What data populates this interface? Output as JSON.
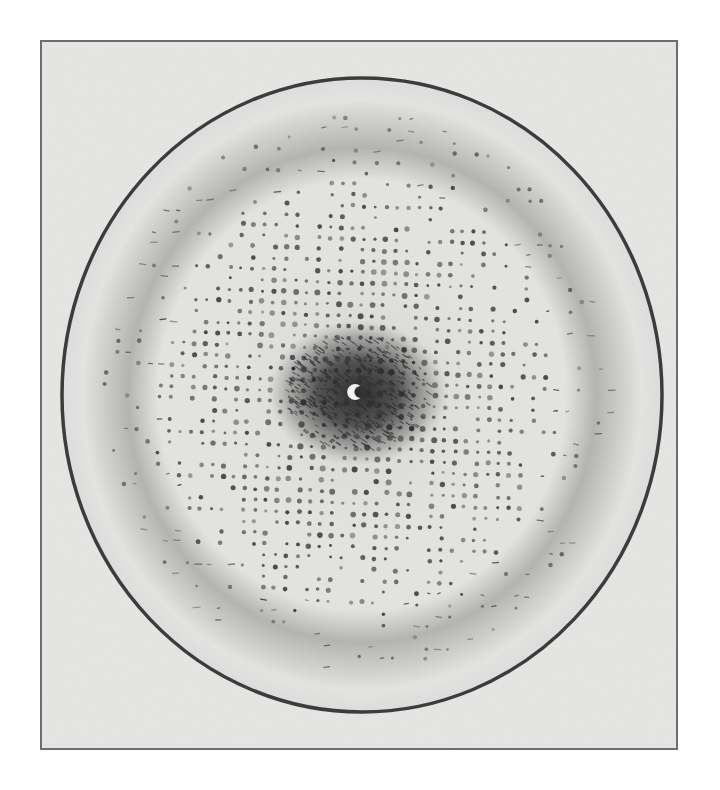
{
  "figure": {
    "caption": ""
  },
  "canvas": {
    "width": 720,
    "height": 790,
    "background": "#ffffff"
  },
  "frame": {
    "x": 41,
    "y": 41,
    "width": 636,
    "height": 708,
    "fill": "#e6e6e4",
    "stroke": "#6b6b6b",
    "stroke_width": 2
  },
  "film": {
    "cx": 362,
    "cy": 395,
    "rx": 300,
    "ry": 317,
    "edge_color": "#3c3c3c",
    "edge_width": 3.5,
    "fill_center": "#d7d7d5",
    "fill_mid": "#e4e4e2",
    "halo_color": "#b3b3b1",
    "halo_radius_fraction": 0.78,
    "outer_color": "#dedede"
  },
  "pattern": {
    "center": {
      "x": 358,
      "y": 393
    },
    "spot_color": "#3a3a3a",
    "core_color": "#262626",
    "core_rx": 72,
    "core_ry": 58,
    "lattice_spacing": 11,
    "lattice_rotation_deg": 2,
    "spot_zone_rx": 250,
    "spot_zone_ry": 275,
    "spot_radius_min": 1.4,
    "spot_radius_max": 3.4,
    "seed": 1953
  },
  "beam_stop": {
    "x": 356,
    "y": 392,
    "r": 8,
    "color": "#f4f4f2",
    "notch_direction": "right"
  }
}
